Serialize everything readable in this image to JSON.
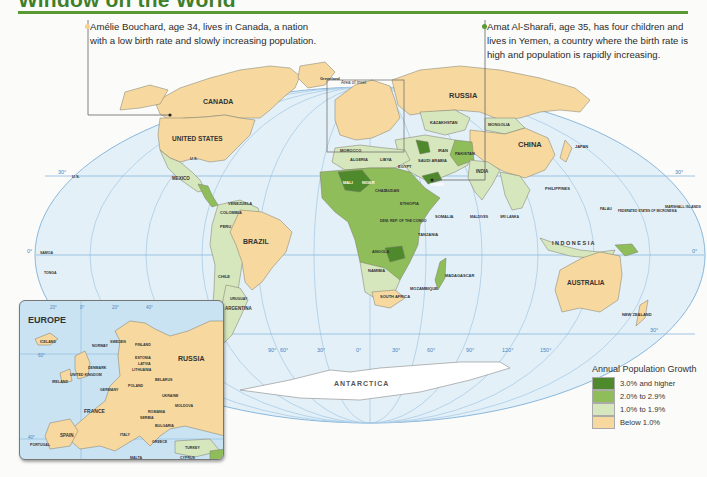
{
  "header": {
    "title": "Window on the World"
  },
  "callouts": [
    {
      "text": "Amélie Bouchard, age 34, lives in Canada, a nation with a low birth rate and slowly increasing population.",
      "line1": "Amélie Bouchard, age 34, lives in Canada, a nation",
      "line2": "with a low birth rate and slowly increasing population.",
      "dot_color": "#f5d18c"
    },
    {
      "text": "Amat Al-Sharafi, age 35, has four children and lives in Yemen, a country where the birth rate is high and population is rapidly increasing.",
      "line1": "Amat Al-Sharafi, age 35, has four children and",
      "line2": "lives in Yemen, a country where the birth rate is",
      "line3": "high and population is rapidly increasing.",
      "dot_color": "#5a9a33"
    }
  ],
  "map": {
    "area_of_inset_label": "Area of inset",
    "ocean_color": "#e3f0f8",
    "graticule_color": "#8ab8dc",
    "latitude_labels": [
      "30°",
      "0°",
      "30°"
    ],
    "longitude_labels": [
      "150°",
      "120°",
      "90°",
      "60°",
      "30°",
      "0°",
      "30°",
      "60°",
      "90°",
      "120°",
      "150°"
    ],
    "major_labels": {
      "canada": "CANADA",
      "united_states": "UNITED STATES",
      "russia": "RUSSIA",
      "china": "CHINA",
      "brazil": "BRAZIL",
      "australia": "AUSTRALIA",
      "antarctica": "ANTARCTICA",
      "indonesia": "I N D O N E S I A",
      "greenland": "Greenland",
      "greenland_sub": "(Den.)",
      "mexico": "MEXICO",
      "argentina": "ARGENTINA",
      "india": "INDIA",
      "mongolia": "MONGOLIA",
      "kazakhstan": "KAZAKHSTAN",
      "algeria": "ALGERIA",
      "libya": "LIBYA",
      "egypt": "EGYPT",
      "sudan": "SUDAN",
      "mali": "MALI",
      "niger": "NIGER",
      "chad": "CHAD",
      "angola": "ANGOLA",
      "namibia": "NAMIBIA",
      "south_africa": "SOUTH AFRICA",
      "saudi_arabia": "SAUDI ARABIA",
      "iran": "IRAN",
      "pakistan": "PAKISTAN",
      "yemen": "YEMEN",
      "morocco": "MOROCCO",
      "peru": "PERU",
      "chile": "CHILE",
      "colombia": "COLOMBIA",
      "venezuela": "VENEZUELA",
      "bolivia": "BOLIVIA",
      "philippines": "PHILIPPINES",
      "japan": "JAPAN",
      "madagascar": "MADAGASCAR",
      "new_zealand": "NEW ZEALAND",
      "mozambique": "MOZAMBIQUE",
      "dem_rep_congo": "DEM. REP. OF THE CONGO",
      "ethiopia": "ETHIOPIA",
      "zambia": "ZAMBIA",
      "tanzania": "TANZANIA",
      "somalia": "SOMALIA",
      "vietnam": "VIETNAM",
      "thailand": "THAILAND",
      "malaysia": "MALAYSIA",
      "us_hawaii": "U.S.",
      "us_alaska": "U.S.",
      "samoa": "SAMOA",
      "tonga": "TONGA",
      "marshall_islands": "MARSHALL ISLANDS",
      "federated_states": "FEDERATED STATES OF MICRONESIA",
      "palau": "PALAU",
      "uruguay": "URUGUAY",
      "paraguay": "PARAGUAY",
      "ecuador": "ECUADOR",
      "suriname": "SURINAME",
      "french_guiana": "French Guiana (Fr.)",
      "maldives": "MALDIVES",
      "sri_lanka": "SRI LANKA",
      "mauritius": "MAURITIUS",
      "comoros": "COMOROS",
      "seychelles": "SEYCHELLES",
      "new_caledonia": "New Caledonia (Fr.)",
      "vanuatu": "VANUATU",
      "fiji": "FIJI",
      "solomon_islands": "SOLOMON ISLANDS",
      "tuvalu": "TUVALU",
      "kiribati": "KIRIBATI",
      "nauru": "NAURU",
      "timor_leste": "TIMOR-LESTE",
      "bangladesh": "BANGLADESH",
      "cambodia": "CAMBODIA",
      "hong_kong": "Hong Kong",
      "taiwan": "Taiwan",
      "north_korea": "NORTH KOREA",
      "south_korea": "SOUTH KOREA"
    },
    "colors": {
      "high": "#4e8a2b",
      "mid": "#8fbd5a",
      "low": "#d6e6bd",
      "below": "#f7d9a0"
    }
  },
  "inset": {
    "title": "EUROPE",
    "lat_labels": [
      "60°",
      "40°"
    ],
    "lon_labels": [
      "20°",
      "0°",
      "20°",
      "40°"
    ],
    "labels": {
      "russia": "RUSSIA",
      "iceland": "ICELAND",
      "norway": "NORWAY",
      "sweden": "SWEDEN",
      "finland": "FINLAND",
      "estonia": "ESTONIA",
      "latvia": "LATVIA",
      "lithuania": "LITHUANIA",
      "denmark": "DENMARK",
      "united_kingdom": "UNITED KINGDOM",
      "ireland": "IRELAND",
      "netherlands": "NETH.",
      "belgium": "BEL.",
      "luxembourg": "LUX.",
      "germany": "GERMANY",
      "poland": "POLAND",
      "belarus": "BELARUS",
      "ukraine": "UKRAINE",
      "moldova": "MOLDOVA",
      "czech": "CZECH REP.",
      "slovakia": "SLOV.",
      "austria": "AUS.",
      "hungary": "HUNG.",
      "switzerland": "SWITZ.",
      "france": "FRANCE",
      "romania": "ROMANIA",
      "serbia": "SERBIA",
      "bulgaria": "BULGARIA",
      "italy": "ITALY",
      "spain": "SPAIN",
      "portugal": "PORTUGAL",
      "greece": "GREECE",
      "turkey": "TURKEY",
      "malta": "MALTA",
      "cyprus": "CYPRUS"
    }
  },
  "legend": {
    "title": "Annual Population Growth",
    "items": [
      {
        "label": "3.0% and higher",
        "color": "#4e8a2b"
      },
      {
        "label": "2.0% to 2.9%",
        "color": "#8fbd5a"
      },
      {
        "label": "1.0% to 1.9%",
        "color": "#d6e6bd"
      },
      {
        "label": "Below 1.0%",
        "color": "#f7d9a0"
      }
    ]
  }
}
